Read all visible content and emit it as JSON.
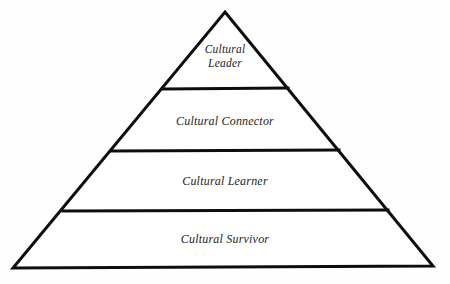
{
  "figure": {
    "kind": "pyramid-diagram",
    "background_color": "#fefefe",
    "stroke_color": "#0d0d0d",
    "text_color": "#232323",
    "width": 450,
    "height": 284
  },
  "geometry": {
    "apex": {
      "x": 225,
      "y": 12
    },
    "base_left": {
      "x": 13,
      "y": 268
    },
    "base_right": {
      "x": 433,
      "y": 266
    },
    "stroke_width": 3,
    "divider_stroke_width": 3,
    "dividers": [
      {
        "y": 89,
        "x1": 163,
        "x2": 288
      },
      {
        "y": 151,
        "x1": 112,
        "x2": 339
      },
      {
        "y": 211,
        "x1": 63,
        "x2": 388
      }
    ]
  },
  "tiers": [
    {
      "id": "cultural-leader",
      "level": 4,
      "label": "Cultural\nLeader",
      "label_lines": [
        "Cultural",
        "Leader"
      ],
      "position": "top"
    },
    {
      "id": "cultural-connector",
      "level": 3,
      "label": "Cultural Connector",
      "label_lines": [
        "Cultural Connector"
      ],
      "position": "upper-middle"
    },
    {
      "id": "cultural-learner",
      "level": 2,
      "label": "Cultural Learner",
      "label_lines": [
        "Cultural Learner"
      ],
      "position": "lower-middle"
    },
    {
      "id": "cultural-survivor",
      "level": 1,
      "label": "Cultural Survivor",
      "label_lines": [
        "Cultural Survivor"
      ],
      "position": "base"
    }
  ]
}
